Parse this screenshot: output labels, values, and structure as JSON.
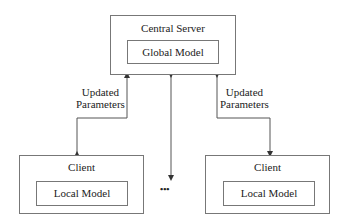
{
  "server": {
    "title": "Central Server",
    "model": "Global Model"
  },
  "clients": [
    {
      "title": "Client",
      "model": "Local Model"
    },
    {
      "title": "Client",
      "model": "Local Model"
    }
  ],
  "edges": {
    "left_label_1": "Updated",
    "left_label_2": "Parameters",
    "right_label_1": "Updated",
    "right_label_2": "Parameters"
  },
  "ellipsis": "•••"
}
